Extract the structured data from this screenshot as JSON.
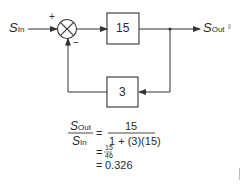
{
  "diagram": {
    "type": "feedback-block-diagram",
    "input": {
      "symbol": "S",
      "subscript": "In"
    },
    "output": {
      "symbol": "S",
      "subscript": "Out"
    },
    "summing_junction": {
      "plus_sign": "+",
      "minus_sign": "−"
    },
    "forward_block": {
      "gain": "15"
    },
    "feedback_block": {
      "gain": "3"
    }
  },
  "equation": {
    "lhs_num_symbol": "S",
    "lhs_num_sub": "Out",
    "lhs_den_symbol": "S",
    "lhs_den_sub": "In",
    "eq1": "=",
    "rhs1_num": "15",
    "rhs1_den": "1 + (3)(15)",
    "eq2": "=",
    "rhs2_num": "15",
    "rhs2_den": "46",
    "eq3": "=",
    "rhs3": "0.326"
  },
  "colors": {
    "line": "#333333",
    "background": "#ffffff"
  }
}
